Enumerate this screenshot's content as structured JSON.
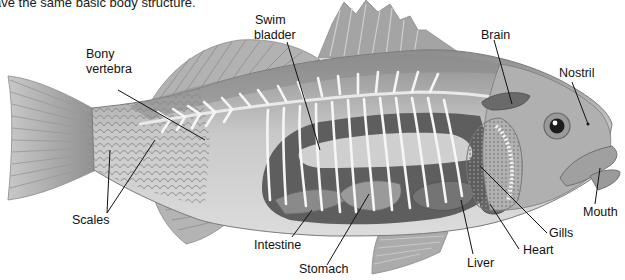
{
  "caption": "ave the same basic body structure.",
  "diagram": {
    "labels": {
      "swim_bladder_1": "Swim",
      "swim_bladder_2": "bladder",
      "brain": "Brain",
      "nostril": "Nostril",
      "bony_vertebra_1": "Bony",
      "bony_vertebra_2": "vertebra",
      "scales": "Scales",
      "intestine": "Intestine",
      "stomach": "Stomach",
      "liver": "Liver",
      "heart": "Heart",
      "gills": "Gills",
      "mouth": "Mouth"
    },
    "colors": {
      "background": "#ffffff",
      "body_gray": "#b8b8b8",
      "dark_organ": "#6a6a6a",
      "bone_white": "#f4f4f4",
      "fin_gray": "#a9a9a9",
      "leader_line": "#111111"
    }
  }
}
